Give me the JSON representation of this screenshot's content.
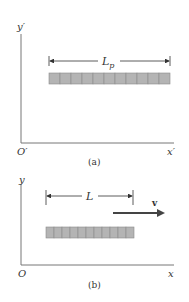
{
  "panel_a": {
    "y_axis_label": "y′",
    "x_axis_label": "x′",
    "origin_label": "O′",
    "length_label_main": "L",
    "length_label_sub": "p",
    "caption": "(a)",
    "rod_segments": 11
  },
  "panel_b": {
    "y_axis_label": "y",
    "x_axis_label": "x",
    "origin_label": "O",
    "length_label": "L",
    "velocity_label": "v",
    "caption": "(b)",
    "rod_segments": 11
  },
  "colors": {
    "axis": "#777777",
    "rod_fill": "#b4b4b4",
    "rod_stroke": "#8a8a8a",
    "arrow": "#444444",
    "text": "#333333"
  }
}
